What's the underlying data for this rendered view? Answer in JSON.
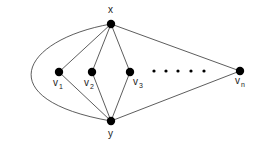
{
  "diagram": {
    "title": "",
    "nodes": [
      {
        "id": "x",
        "label": "x",
        "sub": "",
        "cx": 111,
        "cy": 24,
        "lx": 108,
        "ly": 13
      },
      {
        "id": "y",
        "label": "y",
        "sub": "",
        "cx": 111,
        "cy": 121,
        "lx": 108,
        "ly": 137
      },
      {
        "id": "v1",
        "label": "v",
        "sub": "1",
        "cx": 59,
        "cy": 72,
        "lx": 53,
        "ly": 86
      },
      {
        "id": "v2",
        "label": "v",
        "sub": "2",
        "cx": 92,
        "cy": 72,
        "lx": 84,
        "ly": 86
      },
      {
        "id": "v3",
        "label": "v",
        "sub": "3",
        "cx": 130,
        "cy": 72,
        "lx": 133,
        "ly": 85
      },
      {
        "id": "vn",
        "label": "v",
        "sub": "n",
        "cx": 240,
        "cy": 71,
        "lx": 235,
        "ly": 84
      }
    ],
    "edges": [
      [
        "x",
        "v1"
      ],
      [
        "x",
        "v2"
      ],
      [
        "x",
        "v3"
      ],
      [
        "x",
        "vn"
      ],
      [
        "y",
        "v1"
      ],
      [
        "y",
        "v2"
      ],
      [
        "y",
        "v3"
      ],
      [
        "y",
        "vn"
      ]
    ],
    "curved_edge": {
      "from": "x",
      "to": "y",
      "path": "M111,24 C20,40 -10,100 111,121"
    },
    "ellipsis_dots": [
      154,
      166,
      178,
      191,
      204
    ],
    "ellipsis_y": 71,
    "node_radius": 4.2,
    "colors": {
      "node": "#000000",
      "edge": "#333333",
      "label": "#222222"
    }
  }
}
